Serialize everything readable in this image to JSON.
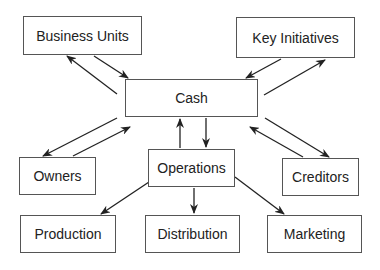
{
  "diagram": {
    "nodes": [
      {
        "id": "business_units",
        "label": "Business Units",
        "x": 23,
        "y": 16,
        "w": 119,
        "h": 39
      },
      {
        "id": "key_initiatives",
        "label": "Key Initiatives",
        "x": 236,
        "y": 17,
        "w": 119,
        "h": 41
      },
      {
        "id": "cash",
        "label": "Cash",
        "x": 125,
        "y": 79,
        "w": 133,
        "h": 38
      },
      {
        "id": "owners",
        "label": "Owners",
        "x": 19,
        "y": 157,
        "w": 77,
        "h": 38
      },
      {
        "id": "operations",
        "label": "Operations",
        "x": 148,
        "y": 149,
        "w": 87,
        "h": 38
      },
      {
        "id": "creditors",
        "label": "Creditors",
        "x": 282,
        "y": 158,
        "w": 77,
        "h": 38
      },
      {
        "id": "production",
        "label": "Production",
        "x": 20,
        "y": 215,
        "w": 96,
        "h": 38
      },
      {
        "id": "distribution",
        "label": "Distribution",
        "x": 145,
        "y": 215,
        "w": 95,
        "h": 38
      },
      {
        "id": "marketing",
        "label": "Marketing",
        "x": 267,
        "y": 215,
        "w": 95,
        "h": 38
      }
    ],
    "edges": [
      {
        "from": "business_units",
        "to": "cash"
      },
      {
        "from": "cash",
        "to": "business_units"
      },
      {
        "from": "key_initiatives",
        "to": "cash"
      },
      {
        "from": "cash",
        "to": "key_initiatives"
      },
      {
        "from": "cash",
        "to": "owners"
      },
      {
        "from": "owners",
        "to": "cash"
      },
      {
        "from": "cash",
        "to": "creditors"
      },
      {
        "from": "creditors",
        "to": "cash"
      },
      {
        "from": "cash",
        "to": "operations"
      },
      {
        "from": "operations",
        "to": "cash"
      },
      {
        "from": "operations",
        "to": "production"
      },
      {
        "from": "operations",
        "to": "distribution"
      },
      {
        "from": "operations",
        "to": "marketing"
      }
    ]
  }
}
